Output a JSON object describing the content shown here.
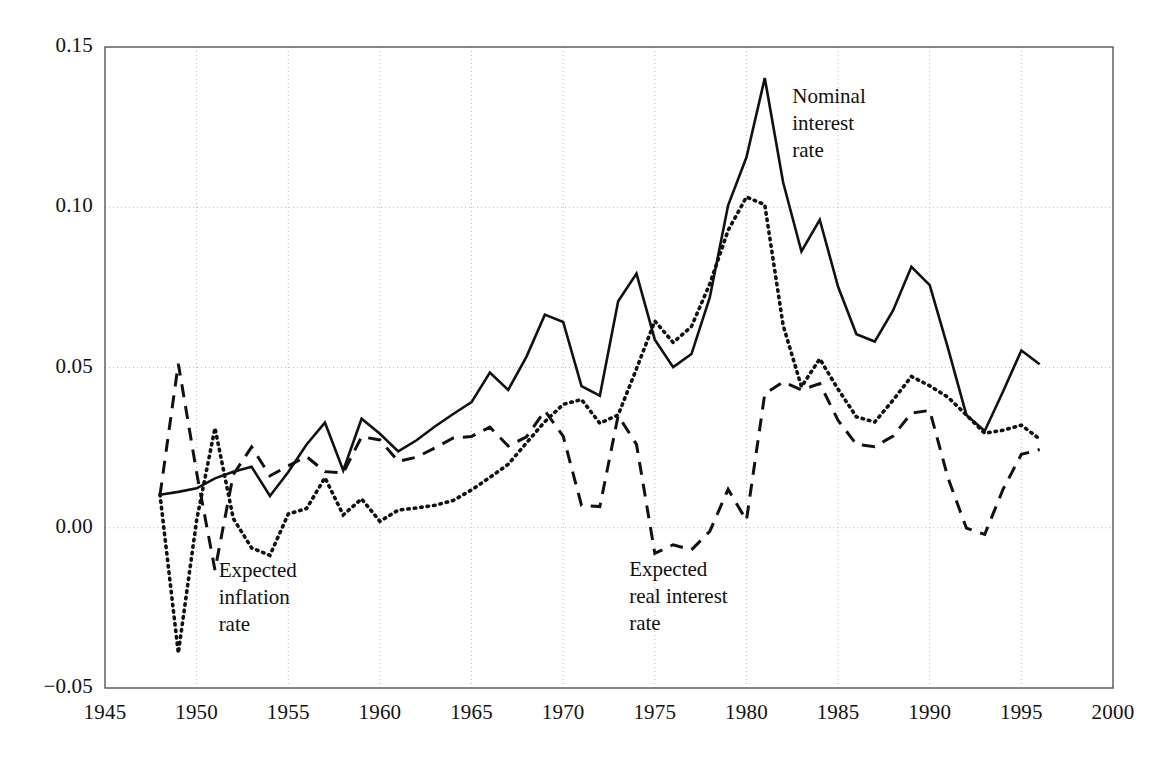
{
  "chart_data": {
    "type": "line",
    "title": "",
    "subtitle": "",
    "xlabel": "",
    "ylabel": "",
    "xlim": [
      1945,
      2000
    ],
    "ylim": [
      -0.05,
      0.15
    ],
    "grid": true,
    "legend_position": "inline-annotations",
    "xticks": [
      "1945",
      "1950",
      "1955",
      "1960",
      "1965",
      "1970",
      "1975",
      "1980",
      "1985",
      "1990",
      "1995",
      "2000"
    ],
    "xtick_values": [
      1945,
      1950,
      1955,
      1960,
      1965,
      1970,
      1975,
      1980,
      1985,
      1990,
      1995,
      2000
    ],
    "yticks": [
      "-0.05",
      "0.00",
      "0.05",
      "0.10",
      "0.15"
    ],
    "ytick_values": [
      -0.05,
      0.0,
      0.05,
      0.1,
      0.15
    ],
    "x": [
      1948,
      1949,
      1950,
      1951,
      1952,
      1953,
      1954,
      1955,
      1956,
      1957,
      1958,
      1959,
      1960,
      1961,
      1962,
      1963,
      1964,
      1965,
      1966,
      1967,
      1968,
      1969,
      1970,
      1971,
      1972,
      1973,
      1974,
      1975,
      1976,
      1977,
      1978,
      1979,
      1980,
      1981,
      1982,
      1983,
      1984,
      1985,
      1986,
      1987,
      1988,
      1989,
      1990,
      1991,
      1992,
      1993,
      1994,
      1995,
      1996
    ],
    "series": [
      {
        "name": "Nominal interest rate",
        "style": "solid",
        "color": "#111111",
        "values": [
          0.0103,
          0.0112,
          0.0123,
          0.0154,
          0.0175,
          0.019,
          0.0099,
          0.0174,
          0.026,
          0.0328,
          0.0179,
          0.034,
          0.0293,
          0.0238,
          0.0273,
          0.0316,
          0.0355,
          0.0392,
          0.0484,
          0.043,
          0.0534,
          0.0665,
          0.0642,
          0.0442,
          0.0412,
          0.0707,
          0.0793,
          0.0587,
          0.0501,
          0.0542,
          0.0719,
          0.1006,
          0.1156,
          0.1403,
          0.1078,
          0.0862,
          0.0961,
          0.0752,
          0.0604,
          0.0581,
          0.0678,
          0.0814,
          0.0757,
          0.056,
          0.0352,
          0.0302,
          0.0425,
          0.0553,
          0.051
        ]
      },
      {
        "name": "Expected inflation rate",
        "style": "dotted",
        "color": "#111111",
        "values": [
          0.0104,
          -0.0391,
          0.0024,
          0.0311,
          0.0029,
          -0.0063,
          -0.0086,
          0.0043,
          0.006,
          0.0156,
          0.004,
          0.009,
          0.002,
          0.0055,
          0.0062,
          0.007,
          0.0085,
          0.0118,
          0.0157,
          0.0198,
          0.0265,
          0.0331,
          0.0385,
          0.04,
          0.0326,
          0.0352,
          0.0496,
          0.0645,
          0.0578,
          0.0628,
          0.0761,
          0.0928,
          0.1032,
          0.1008,
          0.0632,
          0.044,
          0.0527,
          0.0432,
          0.0346,
          0.033,
          0.0398,
          0.0472,
          0.0443,
          0.0407,
          0.0352,
          0.0295,
          0.0304,
          0.032,
          0.0277
        ]
      },
      {
        "name": "Expected real interest rate",
        "style": "dashed",
        "color": "#111111",
        "values": [
          0.0101,
          0.0512,
          0.0172,
          -0.0132,
          0.0166,
          0.0252,
          0.0162,
          0.0193,
          0.0222,
          0.0175,
          0.0171,
          0.0284,
          0.0274,
          0.0207,
          0.022,
          0.0249,
          0.028,
          0.0285,
          0.0314,
          0.0255,
          0.0284,
          0.0365,
          0.0286,
          0.007,
          0.0066,
          0.035,
          0.026,
          -0.008,
          -0.0053,
          -0.0069,
          -0.0011,
          0.012,
          0.0023,
          0.0418,
          0.0455,
          0.043,
          0.045,
          0.0335,
          0.026,
          0.0253,
          0.0286,
          0.0358,
          0.0366,
          0.0155,
          -0.0001,
          -0.0021,
          0.012,
          0.0229,
          0.0244
        ]
      }
    ],
    "annotations": [
      {
        "id": "nominal",
        "text": "Nominal\ninterest\nrate",
        "x": 1982.5,
        "y": 0.1357,
        "series": "Nominal interest rate"
      },
      {
        "id": "expected-inflation",
        "text": "Expected\ninflation\nrate",
        "x": 1951.2,
        "y": -0.0122,
        "series": "Expected inflation rate"
      },
      {
        "id": "expected-real",
        "text": "Expected\nreal interest\nrate",
        "x": 1973.6,
        "y": -0.0118,
        "series": "Expected real interest rate"
      }
    ],
    "geometry": {
      "plot_left": 105,
      "plot_right": 1113,
      "plot_top": 47,
      "plot_bottom": 688,
      "frame_color": "#555555",
      "grid_color": "#bbbbbb",
      "background": "#ffffff"
    }
  }
}
